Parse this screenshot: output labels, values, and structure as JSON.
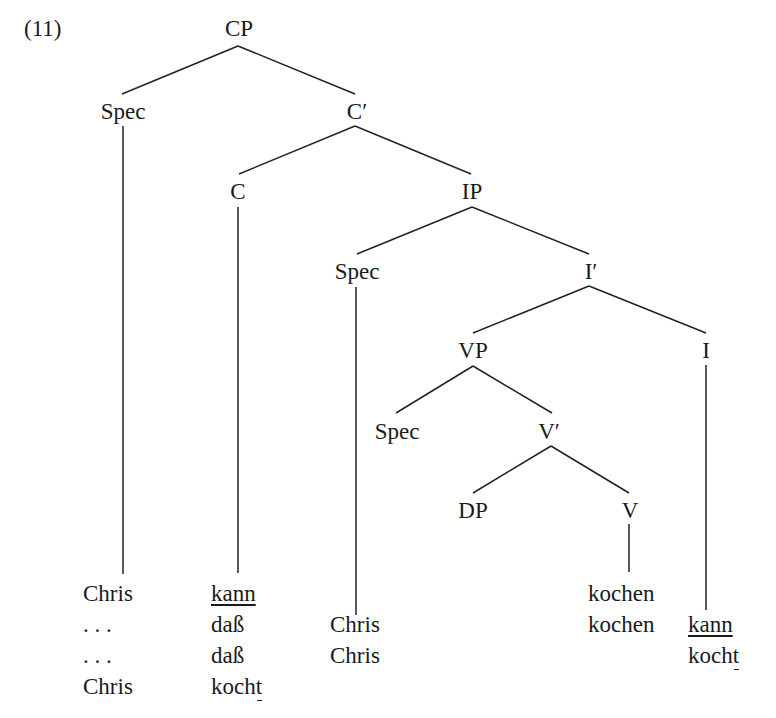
{
  "example_number": "(11)",
  "tree": {
    "nodes": {
      "cp": "CP",
      "spec_cp": "Spec",
      "c_bar": "C′",
      "c": "C",
      "ip": "IP",
      "spec_ip": "Spec",
      "i_bar": "I′",
      "vp": "VP",
      "i": "I",
      "spec_vp": "Spec",
      "v_bar": "V′",
      "dp": "DP",
      "v": "V"
    },
    "edges": [
      [
        "CP",
        "Spec"
      ],
      [
        "CP",
        "C′"
      ],
      [
        "C′",
        "C"
      ],
      [
        "C′",
        "IP"
      ],
      [
        "IP",
        "Spec"
      ],
      [
        "IP",
        "I′"
      ],
      [
        "I′",
        "VP"
      ],
      [
        "I′",
        "I"
      ],
      [
        "VP",
        "Spec"
      ],
      [
        "VP",
        "V′"
      ],
      [
        "V′",
        "DP"
      ],
      [
        "V′",
        "V"
      ]
    ]
  },
  "leaves": {
    "spec_cp": [
      "Chris",
      ". . .",
      ". . .",
      "Chris"
    ],
    "c": [
      "kann",
      "daß",
      "daß",
      "kocht"
    ],
    "spec_ip": [
      "Chris",
      "Chris"
    ],
    "v": [
      "kochen",
      "kochen"
    ],
    "i": [
      "kann",
      "kocht"
    ]
  },
  "annotations": {
    "underlined_whole_words": [
      "kann"
    ],
    "underlined_trailing_t": [
      "kocht"
    ]
  }
}
